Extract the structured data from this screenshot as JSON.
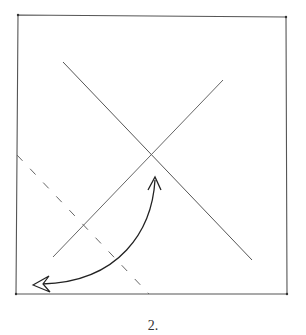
{
  "diagram": {
    "type": "origami-fold-instruction",
    "step_label": "2.",
    "colors": {
      "background": "#ffffff",
      "line": "#555555",
      "arrow": "#222222"
    },
    "paper_square": {
      "corners": [
        [
          18,
          15
        ],
        [
          286,
          17
        ],
        [
          287,
          294
        ],
        [
          16,
          294
        ]
      ]
    },
    "creases": [
      {
        "name": "diagonal-crease-nw-se",
        "style": "solid",
        "from": [
          63,
          62
        ],
        "to": [
          252,
          260
        ]
      },
      {
        "name": "diagonal-crease-ne-sw",
        "style": "solid",
        "from": [
          223,
          80
        ],
        "to": [
          53,
          257
        ]
      }
    ],
    "fold_line": {
      "name": "valley-fold-line",
      "style": "dashed",
      "from": [
        17,
        155
      ],
      "to": [
        149,
        294
      ]
    },
    "arrow": {
      "name": "fold-and-unfold-arrow",
      "start": [
        155,
        178
      ],
      "end": [
        35,
        285
      ],
      "start_head": "open-v",
      "end_head": "hollow-triangle"
    }
  }
}
